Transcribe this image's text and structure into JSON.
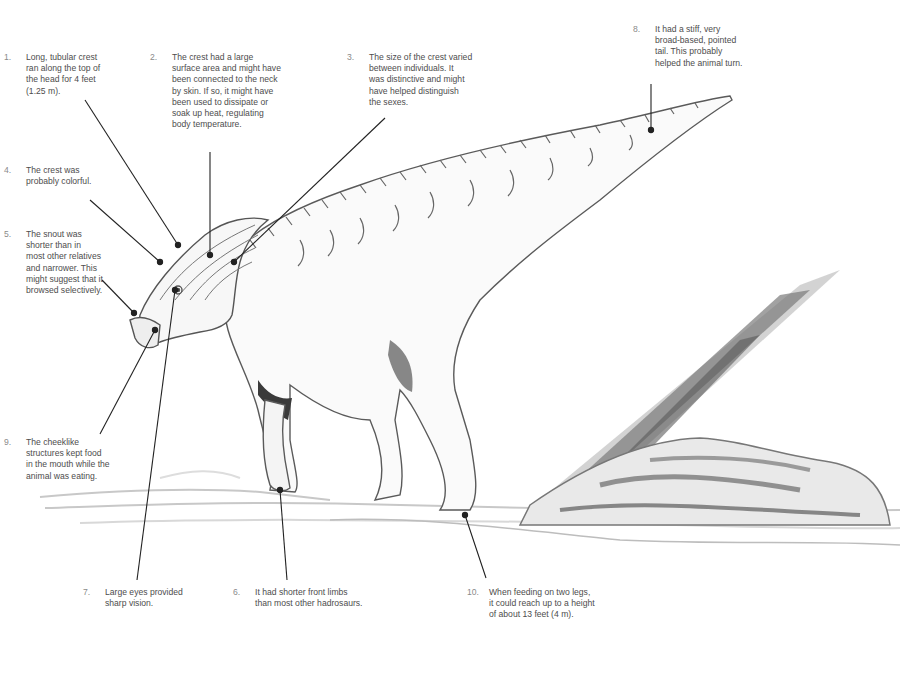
{
  "diagram": {
    "annotations": [
      {
        "num": "1.",
        "text": "Long, tubular crest\nran along the top of\nthe head for 4 feet\n(1.25 m).",
        "target": "crest-top"
      },
      {
        "num": "2.",
        "text": "The crest had a large\nsurface area and might have\nbeen connected to the neck\nby skin. If so, it might have\nbeen used to dissipate or\nsoak up heat, regulating\nbody temperature.",
        "target": "crest-surface"
      },
      {
        "num": "3.",
        "text": "The size of the crest varied\nbetween individuals. It\nwas distinctive and might\nhave helped distinguish\nthe sexes.",
        "target": "crest-back"
      },
      {
        "num": "4.",
        "text": "The crest was\nprobably colorful.",
        "target": "crest-front"
      },
      {
        "num": "5.",
        "text": "The snout was\nshorter than in\nmost other relatives\nand narrower. This\nmight suggest that it\nbrowsed selectively.",
        "target": "snout"
      },
      {
        "num": "6.",
        "text": "It had shorter front limbs\nthan most other hadrosaurs.",
        "target": "front-limb"
      },
      {
        "num": "7.",
        "text": "Large eyes provided\nsharp vision.",
        "target": "eye"
      },
      {
        "num": "8.",
        "text": "It had a stiff, very\nbroad-based, pointed\ntail. This probably\nhelped the animal turn.",
        "target": "tail"
      },
      {
        "num": "9.",
        "text": "The cheeklike\nstructures kept food\nin the mouth while the\nanimal was eating.",
        "target": "cheek"
      },
      {
        "num": "10.",
        "text": "When feeding on two legs,\nit could reach up to a height\nof about 13 feet (4 m).",
        "target": "hind-foot"
      }
    ],
    "colors": {
      "leader_line": "#222222",
      "outline": "#555555",
      "shade": "#9a9a9a",
      "text": "#4d4d4d",
      "number": "#8a8a8a"
    }
  }
}
